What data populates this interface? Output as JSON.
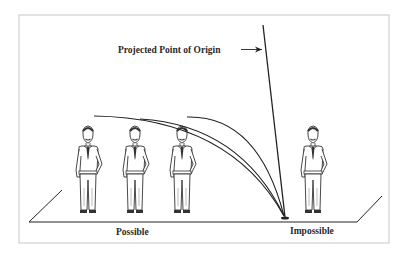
{
  "diagram": {
    "title_label": "Projected Point of Origin",
    "labels": {
      "possible": "Possible",
      "impossible": "Impossible"
    },
    "figures": [
      {
        "id": "person-1",
        "region": "possible",
        "x": 88
      },
      {
        "id": "person-2",
        "region": "possible",
        "x": 135
      },
      {
        "id": "person-3",
        "region": "possible",
        "x": 182
      },
      {
        "id": "person-4",
        "region": "impossible",
        "x": 313
      }
    ],
    "trajectories": [
      {
        "from_figure": "person-1",
        "to": "point-of-origin"
      },
      {
        "from_figure": "person-2",
        "to": "point-of-origin"
      },
      {
        "from_figure": "person-3",
        "to": "point-of-origin"
      }
    ],
    "colors": {
      "ink": "#222222",
      "frame": "#c8c8c8",
      "background": "#ffffff"
    }
  }
}
